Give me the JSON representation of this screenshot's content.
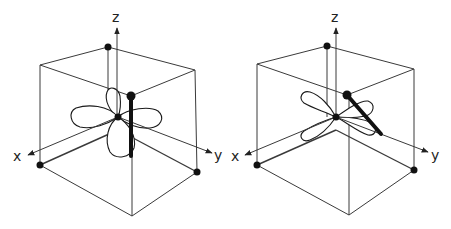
{
  "diagrams": [
    {
      "id": "left",
      "description": "Cube with d-orbital lobes along x and z axes; thick vertical bar",
      "axes": {
        "x": "x",
        "y": "y",
        "z": "z"
      }
    },
    {
      "id": "right",
      "description": "Cube with four-lobe d-orbital; thick diagonal bar toward y",
      "axes": {
        "x": "x",
        "y": "y",
        "z": "z"
      }
    }
  ],
  "colors": {
    "line": "#3a3a3a",
    "ink": "#111111",
    "background": "#ffffff"
  }
}
